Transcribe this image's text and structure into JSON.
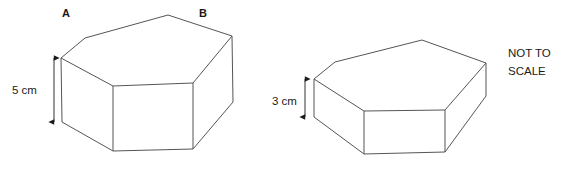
{
  "diagram": {
    "background_color": "#ffffff",
    "stroke_color": "#555555",
    "text_color": "#1a1a1a",
    "not_to_scale_note": {
      "line1": "NOT TO",
      "line2": "SCALE"
    },
    "left_prism": {
      "name": "large-hexagonal-prism",
      "vertex_labels": [
        {
          "text": "A",
          "x": 62,
          "y": 7
        },
        {
          "text": "B",
          "x": 199,
          "y": 7
        }
      ],
      "height_dimension": {
        "value": "5 cm",
        "label_x": 12,
        "label_y": 84,
        "line_x": 54,
        "line_top": 58,
        "line_bottom": 122
      },
      "top_face": [
        [
          61,
          58
        ],
        [
          85,
          38
        ],
        [
          168,
          15
        ],
        [
          232,
          36
        ],
        [
          193,
          83
        ],
        [
          113,
          86
        ]
      ],
      "side_edges": [
        {
          "from": [
            61,
            58
          ],
          "to": [
            62,
            122
          ]
        },
        {
          "from": [
            113,
            86
          ],
          "to": [
            113,
            151
          ]
        },
        {
          "from": [
            193,
            83
          ],
          "to": [
            193,
            149
          ]
        },
        {
          "from": [
            232,
            36
          ],
          "to": [
            233,
            102
          ]
        }
      ],
      "bottom_face": [
        [
          62,
          122
        ],
        [
          113,
          151
        ],
        [
          193,
          149
        ],
        [
          233,
          102
        ]
      ]
    },
    "right_prism": {
      "name": "short-hexagonal-prism",
      "height_dimension": {
        "value": "3 cm",
        "label_x": 272,
        "label_y": 95,
        "line_x": 305,
        "line_top": 79,
        "line_bottom": 117
      },
      "top_face": [
        [
          314,
          79
        ],
        [
          335,
          62
        ],
        [
          422,
          40
        ],
        [
          486,
          63
        ],
        [
          445,
          110
        ],
        [
          364,
          111
        ]
      ],
      "side_edges": [
        {
          "from": [
            314,
            79
          ],
          "to": [
            314,
            117
          ]
        },
        {
          "from": [
            364,
            111
          ],
          "to": [
            364,
            154
          ]
        },
        {
          "from": [
            445,
            110
          ],
          "to": [
            445,
            152
          ]
        },
        {
          "from": [
            486,
            63
          ],
          "to": [
            486,
            96
          ]
        }
      ],
      "bottom_face": [
        [
          314,
          117
        ],
        [
          364,
          154
        ],
        [
          445,
          152
        ],
        [
          486,
          96
        ]
      ]
    }
  }
}
